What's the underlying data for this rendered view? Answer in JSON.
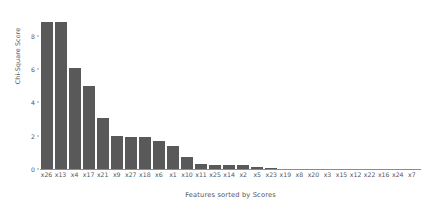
{
  "chart_data": {
    "type": "bar",
    "title": "",
    "xlabel": "Features sorted by Scores",
    "ylabel": "Chi-Square Score",
    "categories": [
      "x26",
      "x13",
      "x4",
      "x17",
      "x21",
      "x9",
      "x27",
      "x18",
      "x6",
      "x1",
      "x10",
      "x11",
      "x25",
      "x14",
      "x2",
      "x5",
      "x23",
      "x19",
      "x8",
      "x20",
      "x3",
      "x15",
      "x12",
      "x22",
      "x16",
      "x24",
      "x7"
    ],
    "values": [
      8.85,
      8.82,
      6.05,
      5.0,
      3.05,
      1.98,
      1.95,
      1.92,
      1.7,
      1.37,
      0.72,
      0.28,
      0.27,
      0.26,
      0.25,
      0.13,
      0.06,
      0.03,
      0.03,
      0.02,
      0.01,
      0.01,
      0.01,
      0.0,
      0.0,
      0.0,
      0.0
    ],
    "ylim": [
      0,
      9.3
    ],
    "yticks": [
      0,
      2,
      4,
      6,
      8
    ],
    "ytick_labels": [
      "0",
      "2",
      "4",
      "6",
      "8"
    ],
    "grid": false,
    "legend": false,
    "bar_color": "#595959",
    "background_color": "#ffffff",
    "axis_color": "#8b8b8b",
    "text_color": "#55565a"
  }
}
